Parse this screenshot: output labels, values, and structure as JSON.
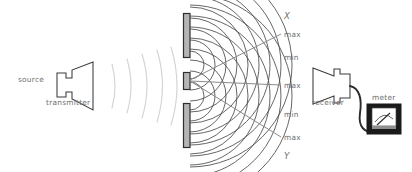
{
  "diagram": {
    "labels": {
      "source": "source",
      "transmitter": "transmitter",
      "receiver": "receiver",
      "meter": "meter",
      "axis_top": "X",
      "axis_bottom": "Y"
    },
    "fringe_labels": [
      {
        "id": "max-upper-outer",
        "text": "max"
      },
      {
        "id": "min-upper",
        "text": "min"
      },
      {
        "id": "max-center",
        "text": "max"
      },
      {
        "id": "min-lower",
        "text": "min"
      },
      {
        "id": "max-lower-outer",
        "text": "max"
      }
    ],
    "colors": {
      "ink": "#3a3a3a",
      "wavefront": "#4a4a4a",
      "incident_wave": "#d2d2d2",
      "ray": "#8a8a8a",
      "label_text": "#6f6f6f",
      "barrier_fill": "#b5b5b5",
      "barrier_stroke": "#3a3a3a",
      "meter_body": "#1a1a1a",
      "meter_face": "#ffffff",
      "background": "#ffffff"
    },
    "components": {
      "incident_wave_arc_count": 5,
      "barrier_segment_count": 3,
      "slit_count": 2,
      "wavefront_arc_count": 10,
      "ray_count": 5
    }
  }
}
